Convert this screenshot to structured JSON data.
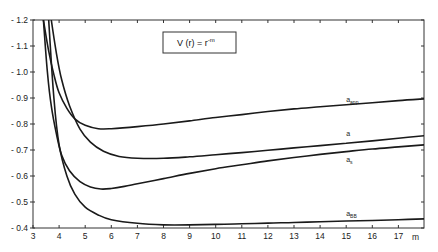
{
  "chart_data": {
    "type": "line",
    "title": "",
    "annotation": {
      "text": "V (r) = r",
      "superscript": "-m"
    },
    "xlabel": "m",
    "ylabel": "",
    "xlim": [
      3,
      18
    ],
    "ylim": [
      0.4,
      1.2
    ],
    "x_ticks": [
      3,
      4,
      5,
      6,
      7,
      8,
      9,
      10,
      11,
      12,
      13,
      14,
      15,
      16,
      17
    ],
    "y_ticks": [
      0.4,
      0.5,
      0.6,
      0.7,
      0.8,
      0.9,
      1.0,
      1.1,
      1.2
    ],
    "y_tick_labels": [
      "0.4",
      "0.5",
      "0.6",
      "0.7",
      "0.8",
      "0.9",
      "1.0",
      "1.1",
      "1.2"
    ],
    "grid": false,
    "legend": "inline labels near curve ends",
    "series": [
      {
        "name": "a_app",
        "label": "a",
        "sub": "app",
        "label_pos": [
          15.0,
          0.885
        ],
        "x": [
          3.4,
          3.6,
          3.8,
          4.0,
          4.3,
          4.6,
          5.0,
          5.5,
          6.0,
          7,
          8,
          9,
          10,
          11,
          12,
          13,
          14,
          15,
          16,
          17,
          18
        ],
        "y": [
          1.2,
          1.08,
          0.99,
          0.92,
          0.86,
          0.82,
          0.795,
          0.782,
          0.782,
          0.79,
          0.8,
          0.812,
          0.825,
          0.836,
          0.848,
          0.858,
          0.866,
          0.874,
          0.882,
          0.89,
          0.897
        ]
      },
      {
        "name": "a",
        "label": "a",
        "sub": "",
        "label_pos": [
          15.0,
          0.755
        ],
        "x": [
          3.7,
          3.9,
          4.1,
          4.4,
          4.8,
          5.2,
          5.7,
          6.3,
          7,
          8,
          9,
          10,
          11,
          12,
          13,
          14,
          15,
          16,
          17,
          18
        ],
        "y": [
          1.2,
          1.07,
          0.97,
          0.87,
          0.78,
          0.73,
          0.695,
          0.675,
          0.668,
          0.668,
          0.674,
          0.682,
          0.69,
          0.699,
          0.708,
          0.717,
          0.726,
          0.735,
          0.745,
          0.755
        ]
      },
      {
        "name": "a_s",
        "label": "a",
        "sub": "s",
        "label_pos": [
          15.0,
          0.655
        ],
        "x": [
          3.4,
          3.55,
          3.7,
          3.9,
          4.1,
          4.4,
          4.8,
          5.2,
          5.6,
          6.0,
          6.5,
          7,
          8,
          9,
          10,
          11,
          12,
          13,
          14,
          15,
          16,
          17,
          18
        ],
        "y": [
          1.2,
          1.0,
          0.87,
          0.76,
          0.68,
          0.62,
          0.578,
          0.558,
          0.55,
          0.552,
          0.56,
          0.57,
          0.59,
          0.61,
          0.628,
          0.643,
          0.658,
          0.671,
          0.683,
          0.694,
          0.704,
          0.712,
          0.72
        ]
      },
      {
        "name": "a_BB",
        "label": "a",
        "sub": "BB",
        "label_pos": [
          15.0,
          0.445
        ],
        "x": [
          3.6,
          3.8,
          4.0,
          4.3,
          4.6,
          5.0,
          5.5,
          6,
          7,
          8,
          9,
          10,
          11,
          12,
          13,
          14,
          15,
          16,
          17,
          18
        ],
        "y": [
          1.2,
          0.9,
          0.72,
          0.6,
          0.53,
          0.48,
          0.45,
          0.432,
          0.418,
          0.412,
          0.412,
          0.414,
          0.416,
          0.419,
          0.421,
          0.424,
          0.427,
          0.429,
          0.432,
          0.435
        ]
      }
    ]
  }
}
